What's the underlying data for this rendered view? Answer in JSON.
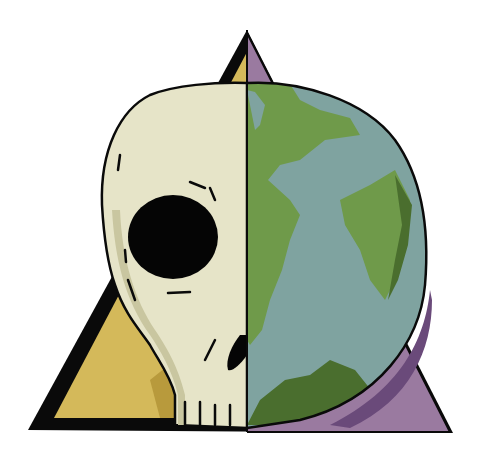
{
  "illustration": {
    "subject": "half skull, half earth globe in front of a triangle",
    "colors": {
      "background": "#ffffff",
      "outline": "#0a0a0a",
      "triangle_left": "#d4b95a",
      "triangle_left_shadow": "#b89a3c",
      "triangle_right": "#9a7aa0",
      "triangle_right_shadow": "#6a4a7a",
      "skull_bone": "#e6e4c8",
      "skull_shade": "#c9c6a0",
      "globe_ocean": "#7fa3a0",
      "globe_ocean_shadow": "#4f6e68",
      "globe_land": "#6f9a4a",
      "globe_land_shadow": "#4a6e2e",
      "eye_socket": "#050505"
    }
  }
}
